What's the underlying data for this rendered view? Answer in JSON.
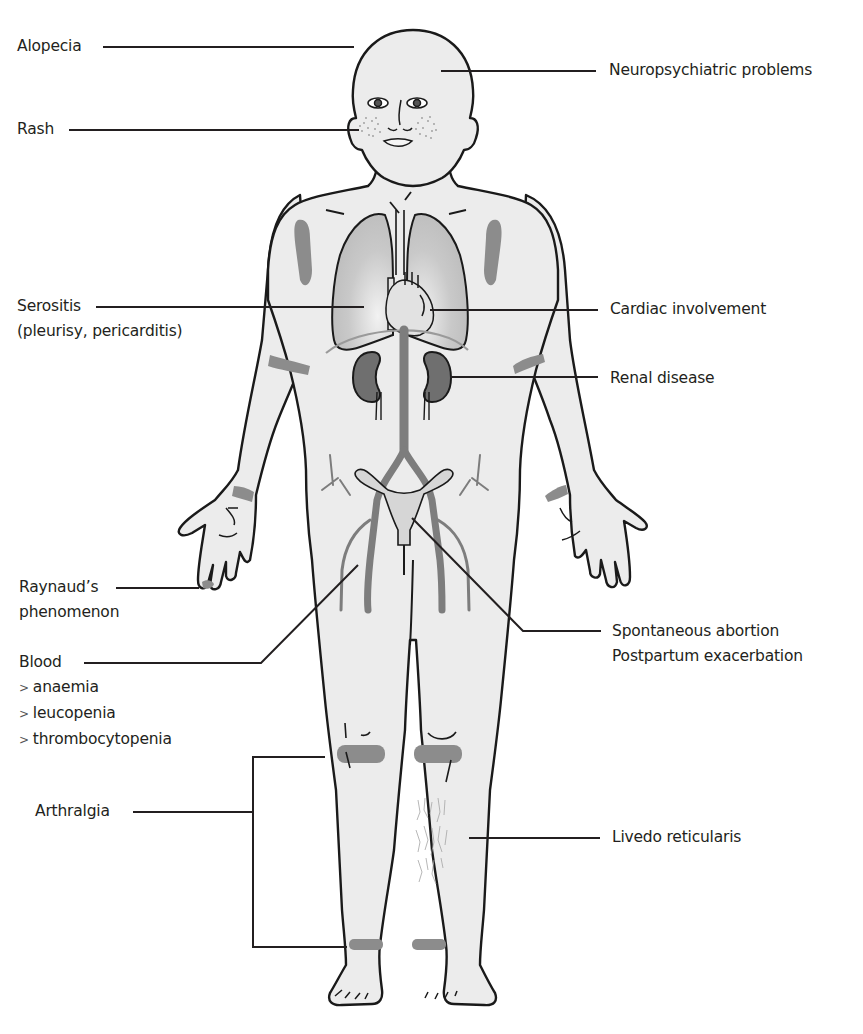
{
  "diagram": {
    "colors": {
      "skin_fill": "#ececec",
      "outline": "#1a1a1a",
      "lesion_gray": "#8c8c8c",
      "organ_dark": "#6f6f6f",
      "lung_fill": "#c4c4c4",
      "leader_line": "#231f20"
    },
    "labels": {
      "alopecia": "Alopecia",
      "neuropsychiatric": "Neuropsychiatric problems",
      "rash": "Rash",
      "serositis": "Serositis",
      "serositis_detail": "(pleurisy, pericarditis)",
      "cardiac": "Cardiac involvement",
      "renal": "Renal disease",
      "raynauds_line1": "Raynaud’s",
      "raynauds_line2": "phenomenon",
      "spontaneous_abortion": "Spontaneous abortion",
      "postpartum": "Postpartum exacerbation",
      "blood": "Blood",
      "blood_items": [
        {
          "bullet": ">",
          "text": "anaemia"
        },
        {
          "bullet": ">",
          "text": "leucopenia"
        },
        {
          "bullet": ">",
          "text": "thrombocytopenia"
        }
      ],
      "arthralgia": "Arthralgia",
      "livedo": "Livedo reticularis"
    }
  }
}
